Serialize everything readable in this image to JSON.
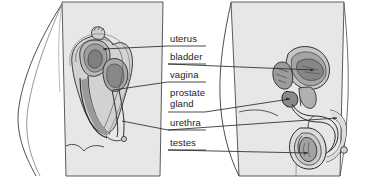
{
  "figure": {
    "name": "reproductive-system-comparison-diagram",
    "background_color": "#ffffff",
    "body_fill": "#e7e7e7",
    "organ_fill": "#b9b9b9",
    "organ_dark_fill": "#8f8f8f",
    "line_color": "#2a2a2a",
    "text_color": "#1c1c1c",
    "width": 385,
    "height": 192
  },
  "bodies": [
    {
      "name": "female-body-silhouette",
      "side": "left"
    },
    {
      "name": "male-body-silhouette",
      "side": "right"
    }
  ],
  "labels": [
    {
      "id": "uterus",
      "text": "uterus",
      "x": 170,
      "y": 35,
      "points_to": "female"
    },
    {
      "id": "bladder",
      "text": "bladder",
      "x": 170,
      "y": 53,
      "points_to": "male"
    },
    {
      "id": "vagina",
      "text": "vagina",
      "x": 170,
      "y": 71,
      "points_to": "female"
    },
    {
      "id": "prostate",
      "text": "prostate\ngland",
      "x": 170,
      "y": 89,
      "points_to": "male"
    },
    {
      "id": "urethra",
      "text": "urethra",
      "x": 170,
      "y": 118,
      "points_to": "both"
    },
    {
      "id": "testes",
      "text": "testes",
      "x": 170,
      "y": 137,
      "points_to": "male"
    }
  ],
  "organs": {
    "female": [
      "uterus",
      "bladder",
      "vagina",
      "urethra"
    ],
    "male": [
      "bladder",
      "prostate gland",
      "urethra",
      "testes",
      "penis",
      "scrotum"
    ]
  }
}
